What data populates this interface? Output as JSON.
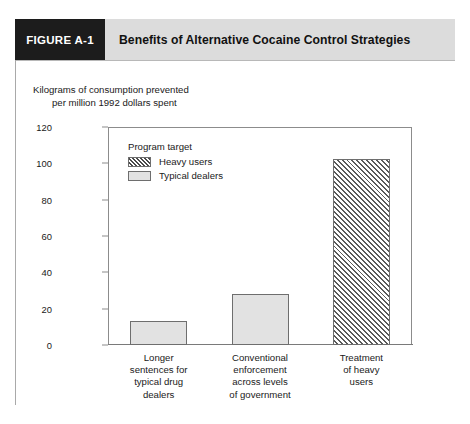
{
  "figure": {
    "number": "FIGURE A-1",
    "title": "Benefits of Alternative Cocaine Control Strategies"
  },
  "axis_caption": {
    "line1": "Kilograms of consumption prevented",
    "line2": "per million 1992 dollars spent"
  },
  "legend": {
    "title": "Program target",
    "entries": [
      {
        "label": "Heavy users",
        "pattern": "hatch"
      },
      {
        "label": "Typical dealers",
        "pattern": "solid"
      }
    ]
  },
  "colors": {
    "header_band": "#dcdcdc",
    "figure_number_box": "#1c1c1c",
    "bar_solid_fill": "#e2e2e2",
    "bar_outline": "#6e6e6e",
    "hatch_line": "#5a5a5a",
    "frame": "#8c8c8c"
  },
  "chart_data": {
    "type": "bar",
    "title": "Benefits of Alternative Cocaine Control Strategies",
    "xlabel": "",
    "ylabel": "Kilograms of consumption prevented per million 1992 dollars spent",
    "ylim": [
      0,
      120
    ],
    "yticks": [
      0,
      20,
      40,
      60,
      80,
      100,
      120
    ],
    "ytick_labels": [
      "0",
      "20",
      "40",
      "60",
      "80",
      "100",
      "120"
    ],
    "grid": false,
    "legend_position": "inside-top-left",
    "categories": [
      "Longer sentences for typical drug dealers",
      "Conventional enforcement across levels of government",
      "Treatment of heavy users"
    ],
    "category_label_lines": [
      [
        "Longer",
        "sentences for",
        "typical drug",
        "dealers"
      ],
      [
        "Conventional",
        "enforcement",
        "across levels",
        "of government"
      ],
      [
        "Treatment",
        "of heavy",
        "users"
      ]
    ],
    "values": [
      13,
      28,
      102.5
    ],
    "series": [
      {
        "name": "Typical dealers",
        "pattern": "solid",
        "points": [
          {
            "category": "Longer sentences for typical drug dealers",
            "value": 13
          },
          {
            "category": "Conventional enforcement across levels of government",
            "value": 28
          }
        ]
      },
      {
        "name": "Heavy users",
        "pattern": "hatch",
        "points": [
          {
            "category": "Treatment of heavy users",
            "value": 102.5
          }
        ]
      }
    ],
    "bars": [
      {
        "category_index": 0,
        "value": 13,
        "pattern": "solid",
        "series": "Typical dealers"
      },
      {
        "category_index": 1,
        "value": 28,
        "pattern": "solid",
        "series": "Typical dealers"
      },
      {
        "category_index": 2,
        "value": 102.5,
        "pattern": "hatch",
        "series": "Heavy users"
      }
    ]
  }
}
